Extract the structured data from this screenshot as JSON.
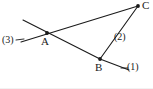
{
  "figure": {
    "kind": "geometry-diagram",
    "width": 153,
    "height": 89,
    "background_color": "#ffffff",
    "stroke_color": "#1a1a1a",
    "label_color": "#1a1a1a",
    "points": [
      {
        "id": "A",
        "label": "A",
        "x": 47,
        "y": 33,
        "label_x": 41,
        "label_y": 36
      },
      {
        "id": "B",
        "label": "B",
        "x": 100,
        "y": 59,
        "label_x": 95,
        "label_y": 62
      },
      {
        "id": "C",
        "label": "C",
        "x": 138,
        "y": 6,
        "label_x": 142,
        "label_y": 1
      }
    ],
    "line_labels": [
      {
        "id": "ray1",
        "label": "(1)",
        "label_x": 127,
        "label_y": 67
      },
      {
        "id": "ray2",
        "label": "(2)",
        "label_x": 115,
        "label_y": 35
      },
      {
        "id": "ray3",
        "label": "(3)",
        "label_x": 3,
        "label_y": 38
      }
    ],
    "segments": [
      {
        "id": "seg-A-C",
        "from": "A",
        "to": "C",
        "x1": 47,
        "y1": 33,
        "x2": 138,
        "y2": 6
      },
      {
        "id": "seg-B-C",
        "from": "B",
        "to": "C",
        "x1": 100,
        "y1": 59,
        "x2": 138,
        "y2": 6
      },
      {
        "id": "seg-A-B",
        "from": "A",
        "to": "B",
        "x1": 47,
        "y1": 33,
        "x2": 100,
        "y2": 59
      },
      {
        "id": "seg-upleft-A",
        "from": "upper-left-end",
        "to": "A",
        "x1": 23,
        "y1": 20,
        "x2": 47,
        "y2": 33
      },
      {
        "id": "seg-lowleft-A",
        "from": "lower-left-end",
        "to": "A",
        "x1": 21,
        "y1": 42,
        "x2": 47,
        "y2": 33
      },
      {
        "id": "seg-B-lowright",
        "from": "B",
        "to": "lower-right-end",
        "x1": 100,
        "y1": 59,
        "x2": 129,
        "y2": 70
      }
    ],
    "tick_marks": [
      {
        "id": "tick-ray3",
        "x1": 17,
        "y1": 40,
        "x2": 22,
        "y2": 40
      },
      {
        "id": "tick-ray1",
        "x1": 122,
        "y1": 68,
        "x2": 127,
        "y2": 68
      },
      {
        "id": "tick-ray2",
        "x1": 111,
        "y1": 37,
        "x2": 114,
        "y2": 35
      }
    ]
  }
}
